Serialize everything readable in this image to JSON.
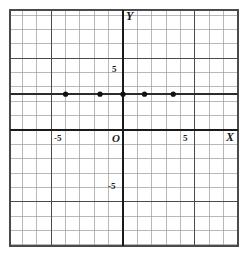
{
  "figure": {
    "kind": "cartesian-coordinate-grid",
    "background": "#ffffff",
    "ink_color": "#2b2b2b",
    "grid_minor_color": "#9a9a9a",
    "grid_major_color": "#4a4a4a",
    "axis_color": "#1a1a1a",
    "point_color": "#111111"
  },
  "labels": {
    "x_axis": "X",
    "y_axis": "Y",
    "origin": "O",
    "x_tick_neg": "-5",
    "x_tick_pos": "5",
    "y_tick_pos": "5",
    "y_tick_neg": "-5"
  },
  "chart_data": {
    "type": "scatter",
    "title": "",
    "xlabel": "X",
    "ylabel": "Y",
    "xlim": [
      -8,
      8
    ],
    "ylim": [
      -8,
      8
    ],
    "grid": true,
    "grid_step": 1,
    "major_grid_step": 5,
    "legend": "none",
    "xticks": [
      -5,
      5
    ],
    "yticks": [
      -5,
      5
    ],
    "xticklabels": [
      "-5",
      "5"
    ],
    "yticklabels": [
      "-5",
      "5"
    ],
    "series": [
      {
        "name": "plotted points",
        "marker": "filled-circle",
        "points": [
          {
            "x": -4,
            "y": 2.5
          },
          {
            "x": -1.6,
            "y": 2.5
          },
          {
            "x": 0,
            "y": 2.5
          },
          {
            "x": 1.5,
            "y": 2.5
          },
          {
            "x": 3.5,
            "y": 2.5
          }
        ]
      }
    ],
    "annotations": [
      {
        "text": "horizontal line through the plotted points at y = 2.5",
        "type": "line",
        "y": 2.5
      }
    ]
  },
  "geometry": {
    "origin_px": {
      "x": 123,
      "y": 130
    },
    "cell_px": 14.35,
    "frame_px": {
      "left": 10,
      "top": 10,
      "right": 238,
      "bottom": 246
    },
    "point_radius_px": 2.6,
    "marker_line_y_px": 95
  }
}
